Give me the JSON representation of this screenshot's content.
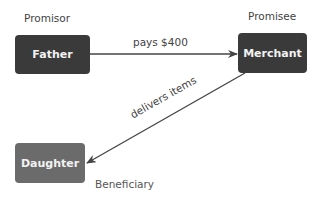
{
  "diagram": {
    "roles": {
      "promisor": "Promisor",
      "promisee": "Promisee",
      "beneficiary": "Beneficiary"
    },
    "nodes": {
      "father": {
        "label": "Father",
        "color": "#3a3a3a"
      },
      "merchant": {
        "label": "Merchant",
        "color": "#3a3a3a"
      },
      "daughter": {
        "label": "Daughter",
        "color": "#6b6b6b"
      }
    },
    "edges": {
      "payment": {
        "from": "Father",
        "to": "Merchant",
        "label": "pays $400"
      },
      "delivery": {
        "from": "Merchant",
        "to": "Daughter",
        "label": "delivers items"
      }
    },
    "colors": {
      "node_text": "#f2f2f2",
      "label_text": "#3f3f3f",
      "edge_line": "#444444"
    }
  }
}
